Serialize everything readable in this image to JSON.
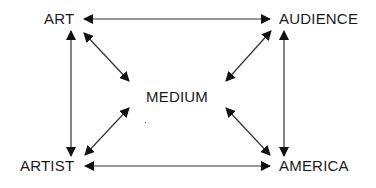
{
  "diagram": {
    "type": "relationship-network",
    "nodes": {
      "art": {
        "label": "ART"
      },
      "audience": {
        "label": "AUDIENCE"
      },
      "medium": {
        "label": "MEDIUM"
      },
      "artist": {
        "label": "ARTIST"
      },
      "america": {
        "label": "AMERICA"
      }
    },
    "edges": [
      {
        "from": "ART",
        "to": "AUDIENCE",
        "direction": "bidirectional"
      },
      {
        "from": "ART",
        "to": "ARTIST",
        "direction": "bidirectional"
      },
      {
        "from": "AUDIENCE",
        "to": "AMERICA",
        "direction": "bidirectional"
      },
      {
        "from": "ARTIST",
        "to": "AMERICA",
        "direction": "bidirectional"
      },
      {
        "from": "ART",
        "to": "MEDIUM",
        "direction": "bidirectional"
      },
      {
        "from": "AUDIENCE",
        "to": "MEDIUM",
        "direction": "bidirectional"
      },
      {
        "from": "ARTIST",
        "to": "MEDIUM",
        "direction": "bidirectional"
      },
      {
        "from": "AMERICA",
        "to": "MEDIUM",
        "direction": "bidirectional"
      }
    ],
    "colors": {
      "line": "#1a1a1a",
      "text": "#1a1a1a",
      "background": "#ffffff"
    }
  }
}
